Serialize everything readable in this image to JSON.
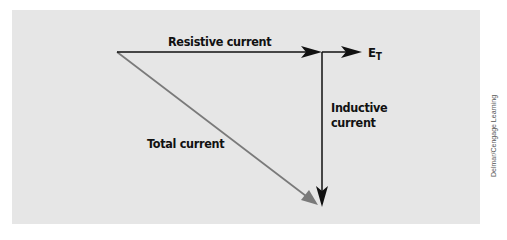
{
  "diagram": {
    "type": "phasor-diagram",
    "background_color": "#e6e6e6",
    "labels": {
      "resistive": "Resistive current",
      "et_main": "E",
      "et_sub": "T",
      "inductive_line1": "Inductive",
      "inductive_line2": "current",
      "total": "Total current"
    },
    "vectors": [
      {
        "name": "Resistive current",
        "from": [
          117,
          52
        ],
        "to": [
          321,
          52
        ],
        "color": "#111111"
      },
      {
        "name": "E_T",
        "from": [
          321,
          52
        ],
        "to": [
          361,
          52
        ],
        "color": "#111111"
      },
      {
        "name": "Inductive current",
        "from": [
          322,
          52
        ],
        "to": [
          322,
          207
        ],
        "color": "#111111"
      },
      {
        "name": "Total current",
        "from": [
          117,
          52
        ],
        "to": [
          318,
          205
        ],
        "color": "#7a7a7a"
      }
    ]
  },
  "credit": "Delmar/Cengage Learning"
}
